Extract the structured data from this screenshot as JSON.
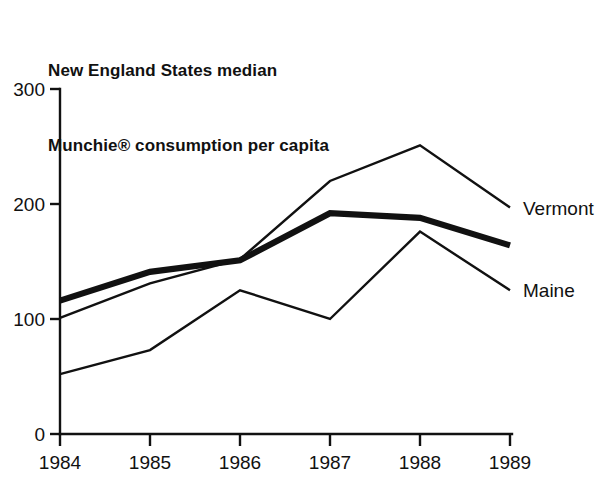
{
  "chart_data": {
    "type": "line",
    "title": "New England States median Munchie® consumption per capita",
    "title_lines": [
      "New England States median",
      "Munchie® consumption per capita"
    ],
    "xlabel": "",
    "ylabel": "",
    "x": [
      "1984",
      "1985",
      "1986",
      "1987",
      "1988",
      "1989"
    ],
    "categories": [
      "1984",
      "1985",
      "1986",
      "1987",
      "1988",
      "1989"
    ],
    "xtick_labels": [
      "1984",
      "1985",
      "1986",
      "1987",
      "1988",
      "1989"
    ],
    "ytick_labels": [
      "0",
      "100",
      "200",
      "300"
    ],
    "ytick_values": [
      0,
      100,
      200,
      300
    ],
    "ylim": [
      0,
      300
    ],
    "grid": false,
    "legend_position": "right-inline-end-of-line",
    "series": [
      {
        "name": "Vermont",
        "label": "Vermont",
        "style": "thin",
        "values": [
          101,
          131,
          152,
          220,
          251,
          197
        ]
      },
      {
        "name": "median",
        "label": "",
        "style": "thick",
        "values": [
          116,
          141,
          151,
          192,
          188,
          164
        ]
      },
      {
        "name": "Maine",
        "label": "Maine",
        "style": "thin",
        "values": [
          52,
          73,
          125,
          100,
          176,
          125
        ]
      }
    ]
  },
  "labels": {
    "vermont": "Vermont",
    "maine": "Maine"
  },
  "axes": {
    "y_0": "0",
    "y_100": "100",
    "y_200": "200",
    "y_300": "300",
    "x_1984": "1984",
    "x_1985": "1985",
    "x_1986": "1986",
    "x_1987": "1987",
    "x_1988": "1988",
    "x_1989": "1989"
  }
}
